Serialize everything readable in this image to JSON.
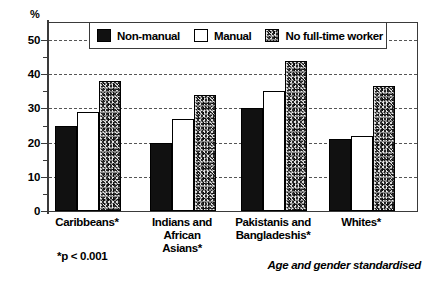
{
  "chart_data": {
    "type": "bar",
    "title": "",
    "subtitle": "",
    "xlabel": "",
    "ylabel": "%",
    "ylim": [
      0,
      55
    ],
    "yticks": [
      0,
      10,
      20,
      30,
      40,
      50
    ],
    "ytick_labels": [
      "0",
      "10",
      "20",
      "30",
      "40",
      "50"
    ],
    "minor_ticks": [
      5,
      15,
      25,
      35,
      45
    ],
    "grid": "horizontal-dashed",
    "legend_position": "top-center",
    "categories": [
      "Caribbeans*",
      "Indians and African Asians*",
      "Pakistanis and Bangladeshis*",
      "Whites*"
    ],
    "category_lines": [
      [
        "Caribbeans*"
      ],
      [
        "Indians and",
        "African",
        "Asians*"
      ],
      [
        "Pakistanis and",
        "Bangladeshis*"
      ],
      [
        "Whites*"
      ]
    ],
    "series": [
      {
        "name": "Non-manual",
        "fill": "solid-black",
        "values": [
          25,
          20,
          30,
          21
        ]
      },
      {
        "name": "Manual",
        "fill": "white",
        "values": [
          29,
          27,
          35,
          22
        ]
      },
      {
        "name": "No full-time worker",
        "fill": "speckled-grey",
        "values": [
          38,
          34,
          44,
          36.5
        ]
      }
    ],
    "annotations": [
      "*p < 0.001",
      "Age and gender standardised"
    ]
  },
  "legend": {
    "items": [
      {
        "label": "Non-manual",
        "swatch": "solid-black"
      },
      {
        "label": "Manual",
        "swatch": "white"
      },
      {
        "label": "No full-time worker",
        "swatch": "speckled-grey"
      }
    ]
  },
  "axis": {
    "y_unit_label": "%",
    "ytick_labels": [
      "50",
      "40",
      "30",
      "20",
      "10",
      "0"
    ]
  },
  "notes": {
    "p_value": "*p < 0.001",
    "standardisation": "Age and gender standardised"
  },
  "colors": {
    "non_manual": "#111111",
    "manual": "#ffffff",
    "no_full_time_worker": "#8a8a8a",
    "axis": "#3a3a3a",
    "grid": "#555555"
  }
}
